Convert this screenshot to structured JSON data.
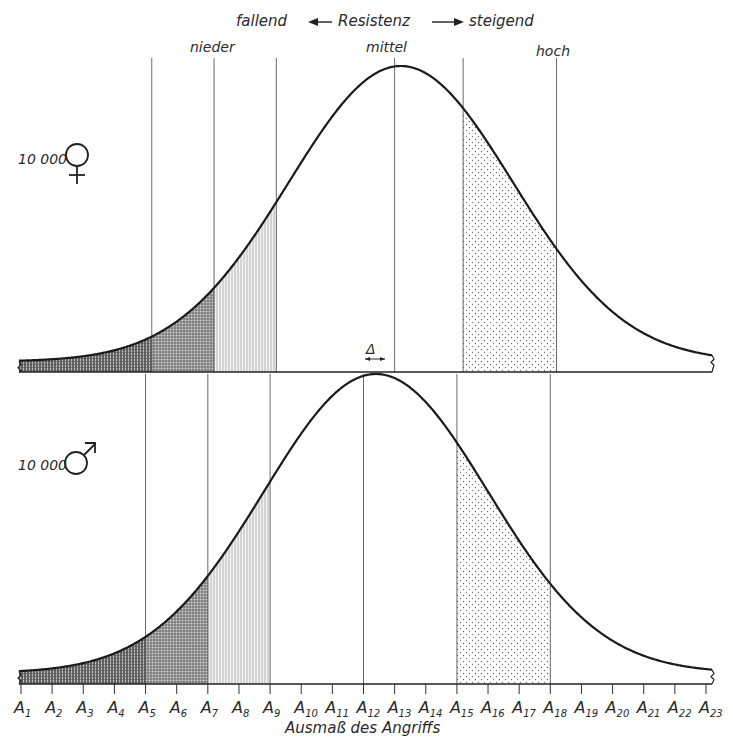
{
  "title": {
    "left": "fallend",
    "center": "Resistenz",
    "right": "steigend"
  },
  "zone_labels": {
    "low": "nieder",
    "mid": "mittel",
    "high": "hoch"
  },
  "panels": [
    {
      "count_label": "10 000",
      "sex_symbol": "♀",
      "sex": "female"
    },
    {
      "count_label": "10 000",
      "sex_symbol": "♂",
      "sex": "male"
    }
  ],
  "delta_label": "Δ",
  "xaxis": {
    "label": "Ausmaß des Angriffs",
    "ticks": [
      "A1",
      "A2",
      "A3",
      "A4",
      "A5",
      "A6",
      "A7",
      "A8",
      "A9",
      "A10",
      "A11",
      "A12",
      "A13",
      "A14",
      "A15",
      "A16",
      "A17",
      "A18",
      "A19",
      "A20",
      "A21",
      "A22",
      "A23"
    ]
  },
  "chart_data": {
    "type": "area",
    "xlabel": "Ausmaß des Angriffs",
    "ylabel": "",
    "x_categories": [
      "A1",
      "A2",
      "A3",
      "A4",
      "A5",
      "A6",
      "A7",
      "A8",
      "A9",
      "A10",
      "A11",
      "A12",
      "A13",
      "A14",
      "A15",
      "A16",
      "A17",
      "A18",
      "A19",
      "A20",
      "A21",
      "A22",
      "A23"
    ],
    "series": [
      {
        "name": "10 000 ♀",
        "distribution": "normal",
        "peak_at": 13.2,
        "sd": 3.6,
        "zone_boundaries": {
          "very_low": 5.2,
          "low_dark": 7.2,
          "low_end": 9.2,
          "mid": 13.0,
          "high_start": 15.2,
          "high_end": 18.2
        },
        "shaded_regions": [
          {
            "from": 1,
            "to": 5.2,
            "pattern": "dense-vertical-hatch"
          },
          {
            "from": 5.2,
            "to": 7.2,
            "pattern": "cross-hatch"
          },
          {
            "from": 7.2,
            "to": 9.2,
            "pattern": "light-vertical-hatch"
          },
          {
            "from": 15.2,
            "to": 18.2,
            "pattern": "dots"
          }
        ]
      },
      {
        "name": "10 000 ♂",
        "distribution": "normal",
        "peak_at": 12.4,
        "sd": 3.6,
        "zone_boundaries": {
          "very_low": 5.0,
          "low_dark": 7.0,
          "low_end": 9.0,
          "mid": 12.0,
          "high_start": 15.0,
          "high_end": 18.0
        },
        "shaded_regions": [
          {
            "from": 1,
            "to": 5.0,
            "pattern": "dense-vertical-hatch"
          },
          {
            "from": 5.0,
            "to": 7.0,
            "pattern": "cross-hatch"
          },
          {
            "from": 7.0,
            "to": 9.0,
            "pattern": "light-vertical-hatch"
          },
          {
            "from": 15.0,
            "to": 18.0,
            "pattern": "dots"
          }
        ]
      }
    ],
    "annotations": [
      "fallend ← Resistenz → steigend",
      "nieder",
      "mittel",
      "hoch",
      "Δ (shift between ♀ and ♂ means)"
    ],
    "grid": false,
    "legend": "none"
  }
}
